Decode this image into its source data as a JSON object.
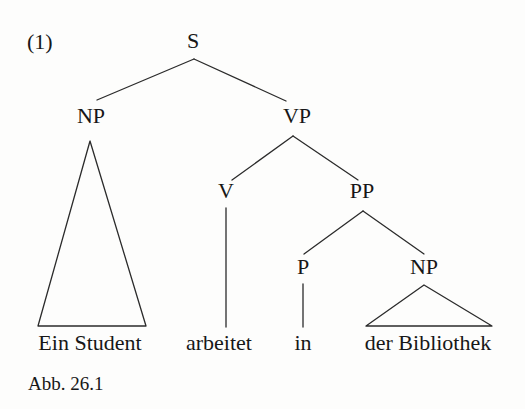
{
  "figure": {
    "example_number": "(1)",
    "caption": "Abb. 26.1",
    "ink_color": "#2b2b2b",
    "background_color": "#fdfdfc"
  },
  "tree": {
    "nodes": [
      {
        "id": "s",
        "label": "S",
        "x": 193,
        "y": 52,
        "level": 0
      },
      {
        "id": "np1",
        "label": "NP",
        "x": 91,
        "y": 127,
        "level": 1
      },
      {
        "id": "vp",
        "label": "VP",
        "x": 297,
        "y": 127,
        "level": 1
      },
      {
        "id": "v",
        "label": "V",
        "x": 226,
        "y": 202,
        "level": 2
      },
      {
        "id": "pp",
        "label": "PP",
        "x": 362,
        "y": 202,
        "level": 2
      },
      {
        "id": "p",
        "label": "P",
        "x": 303,
        "y": 278,
        "level": 3
      },
      {
        "id": "np2",
        "label": "NP",
        "x": 424,
        "y": 278,
        "level": 3
      }
    ],
    "edges": [
      {
        "from": "s",
        "to": "np1",
        "x1": 194,
        "y1": 59,
        "x2": 97,
        "y2": 100
      },
      {
        "from": "s",
        "to": "vp",
        "x1": 194,
        "y1": 59,
        "x2": 286,
        "y2": 101
      },
      {
        "from": "vp",
        "to": "v",
        "x1": 293,
        "y1": 136,
        "x2": 232,
        "y2": 180
      },
      {
        "from": "vp",
        "to": "pp",
        "x1": 293,
        "y1": 136,
        "x2": 358,
        "y2": 180
      },
      {
        "from": "pp",
        "to": "p",
        "x1": 363,
        "y1": 211,
        "x2": 304,
        "y2": 254
      },
      {
        "from": "pp",
        "to": "np2",
        "x1": 363,
        "y1": 211,
        "x2": 424,
        "y2": 254
      },
      {
        "from": "v",
        "to": "arbeitet",
        "x1": 226,
        "y1": 208,
        "x2": 226,
        "y2": 327
      },
      {
        "from": "p",
        "to": "in",
        "x1": 303,
        "y1": 284,
        "x2": 303,
        "y2": 327
      }
    ],
    "triangles": [
      {
        "for": "np1",
        "apex_x": 90,
        "apex_y": 141,
        "left_x": 38,
        "right_x": 146,
        "base_y": 326
      },
      {
        "for": "np2",
        "apex_x": 424,
        "apex_y": 285,
        "left_x": 366,
        "right_x": 492,
        "base_y": 326
      }
    ],
    "leaves": [
      {
        "id": "leaf-ein-student",
        "text": "Ein Student",
        "x": 90,
        "y": 354
      },
      {
        "id": "leaf-arbeitet",
        "text": "arbeitet",
        "x": 219,
        "y": 354
      },
      {
        "id": "leaf-in",
        "text": "in",
        "x": 303,
        "y": 354
      },
      {
        "id": "leaf-der-bibliothek",
        "text": "der Bibliothek",
        "x": 428,
        "y": 354
      }
    ],
    "sentence": "Ein Student arbeitet in der Bibliothek"
  }
}
